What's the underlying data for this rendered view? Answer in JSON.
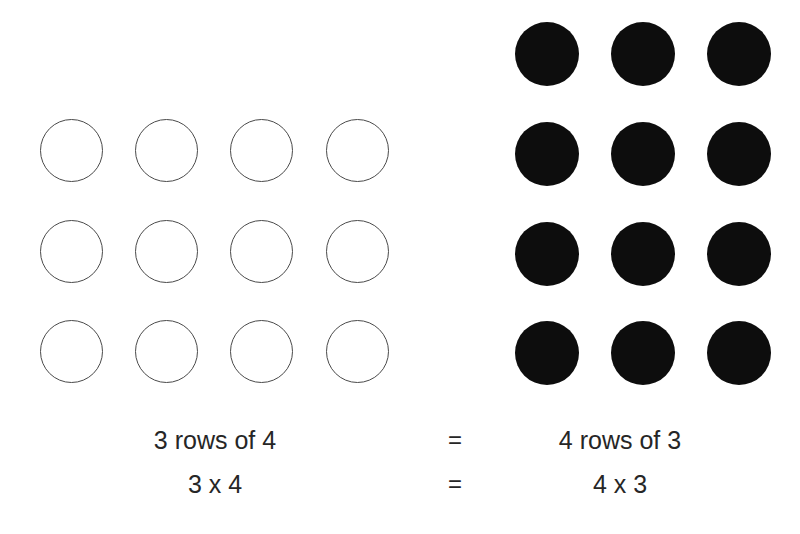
{
  "canvas": {
    "width": 800,
    "height": 534,
    "background": "#ffffff"
  },
  "diagram": {
    "topic": "Commutative property of multiplication shown with counter arrays",
    "colors": {
      "open_counter_fill": "#ffffff",
      "open_counter_stroke": "#4a4a4a",
      "filled_counter": "#0d0d0d",
      "text": "#262626"
    }
  },
  "arrays": {
    "left": {
      "name": "open-counters-array",
      "rows": 3,
      "cols": 4,
      "total": 12,
      "style": "open",
      "row_labels": [
        "row-1",
        "row-2",
        "row-3"
      ]
    },
    "right": {
      "name": "filled-counters-array",
      "rows": 4,
      "cols": 3,
      "total": 12,
      "style": "filled",
      "row_labels": [
        "row-1",
        "row-2",
        "row-3",
        "row-4"
      ]
    }
  },
  "captions": {
    "row_1": {
      "left": "3 rows of 4",
      "equals": "=",
      "right": "4 rows of 3"
    },
    "row_2": {
      "left": "3 x 4",
      "equals": "=",
      "right": "4 x 3"
    }
  }
}
